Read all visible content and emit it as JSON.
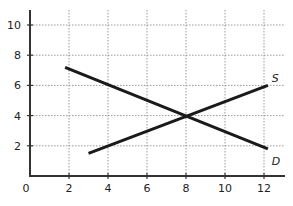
{
  "chart_data": {
    "type": "line",
    "title": "",
    "xlabel": "",
    "ylabel": "",
    "xlim": [
      0,
      12.8
    ],
    "ylim": [
      0,
      11
    ],
    "grid": true,
    "grid_style": "dotted",
    "x_ticks": [
      0,
      2,
      4,
      6,
      8,
      10,
      12
    ],
    "y_ticks": [
      2,
      4,
      6,
      8,
      10
    ],
    "series": [
      {
        "name": "S",
        "label": "S",
        "points": [
          [
            3,
            1.5
          ],
          [
            12.2,
            6
          ]
        ]
      },
      {
        "name": "D",
        "label": "D",
        "points": [
          [
            1.8,
            7.2
          ],
          [
            12.2,
            1.8
          ]
        ]
      }
    ],
    "annotations": [
      {
        "text": "S",
        "x": 12.3,
        "y": 6.2
      },
      {
        "text": "D",
        "x": 12.3,
        "y": 1.5
      }
    ],
    "intersection": [
      8,
      4
    ]
  },
  "colors": {
    "line": "#1a1a1a",
    "axis": "#333333",
    "grid": "#999999"
  }
}
